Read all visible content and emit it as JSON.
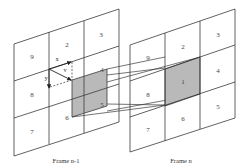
{
  "diagram": {
    "type": "motion-estimation-block-grid",
    "frames": [
      {
        "id": "frame_prev",
        "caption": "Frame n-1",
        "cells": [
          {
            "label": "9"
          },
          {
            "label": "2"
          },
          {
            "label": "3"
          },
          {
            "label": "8"
          },
          {
            "label": "4"
          },
          {
            "label": "7"
          },
          {
            "label": "6"
          },
          {
            "label": "5"
          }
        ],
        "shaded_block_note": "displaced block overlapping cells 1,4,5,6",
        "vectors": {
          "x": "x",
          "y": "y",
          "v": "v"
        }
      },
      {
        "id": "frame_curr",
        "caption": "Frame n",
        "cells": [
          {
            "label": "9"
          },
          {
            "label": "2"
          },
          {
            "label": "3"
          },
          {
            "label": "8"
          },
          {
            "label": "1"
          },
          {
            "label": "4"
          },
          {
            "label": "7"
          },
          {
            "label": "6"
          },
          {
            "label": "5"
          }
        ],
        "shaded_cell": "1"
      }
    ],
    "colors": {
      "line": "#3a3a3a",
      "shade": "#b9b9b9",
      "background": "#ffffff"
    }
  }
}
